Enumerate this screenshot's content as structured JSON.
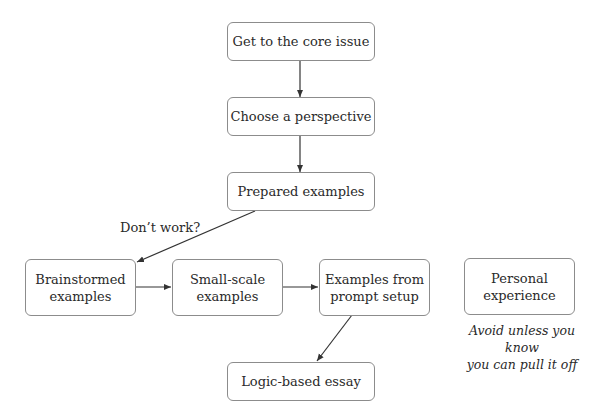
{
  "diagram": {
    "nodes": {
      "core_issue": "Get to the core issue",
      "perspective": "Choose a perspective",
      "prepared": "Prepared examples",
      "brainstormed_1": "Brainstormed",
      "brainstormed_2": "examples",
      "small_scale_1": "Small-scale",
      "small_scale_2": "examples",
      "prompt_setup_1": "Examples from",
      "prompt_setup_2": "prompt setup",
      "personal_1": "Personal",
      "personal_2": "experience",
      "logic_essay": "Logic-based essay"
    },
    "edge_label": "Don’t work?",
    "personal_note_1": "Avoid unless you know",
    "personal_note_2": "you can pull it off",
    "edges": [
      {
        "from": "core_issue",
        "to": "perspective"
      },
      {
        "from": "perspective",
        "to": "prepared"
      },
      {
        "from": "prepared",
        "to": "brainstormed",
        "label": "Don’t work?"
      },
      {
        "from": "brainstormed",
        "to": "small_scale"
      },
      {
        "from": "small_scale",
        "to": "prompt_setup"
      },
      {
        "from": "prompt_setup",
        "to": "logic_essay"
      }
    ],
    "colors": {
      "border": "#8c8c8c",
      "arrow": "#333333",
      "text": "#2a2a2a"
    }
  }
}
